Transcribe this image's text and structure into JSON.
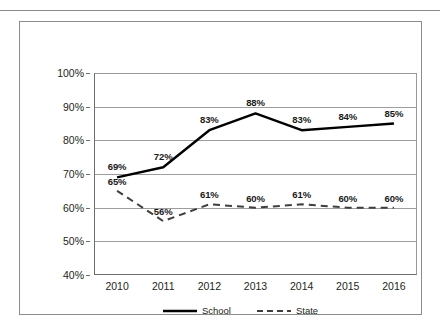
{
  "chart_data": {
    "type": "line",
    "title": "",
    "subtitle": "",
    "xlabel": "",
    "ylabel": "",
    "categories": [
      "2010",
      "2011",
      "2012",
      "2013",
      "2014",
      "2015",
      "2016"
    ],
    "series": [
      {
        "name": "School",
        "style": "solid",
        "color": "#000000",
        "values": [
          69,
          72,
          83,
          88,
          83,
          84,
          85
        ],
        "labels": [
          "69%",
          "72%",
          "83%",
          "88%",
          "83%",
          "84%",
          "85%"
        ]
      },
      {
        "name": "State",
        "style": "dashed",
        "color": "#3f3f3f",
        "values": [
          65,
          56,
          61,
          60,
          61,
          60,
          60
        ],
        "labels": [
          "65%",
          "56%",
          "61%",
          "60%",
          "61%",
          "60%",
          "60%"
        ]
      }
    ],
    "ylim": [
      40,
      100
    ],
    "ytick_values": [
      40,
      50,
      60,
      70,
      80,
      90,
      100
    ],
    "ytick_labels": [
      "40%",
      "50%",
      "60%",
      "70%",
      "80%",
      "90%",
      "100%"
    ],
    "grid": true,
    "legend_position": "bottom",
    "legend_entries": [
      "School",
      "State"
    ]
  }
}
